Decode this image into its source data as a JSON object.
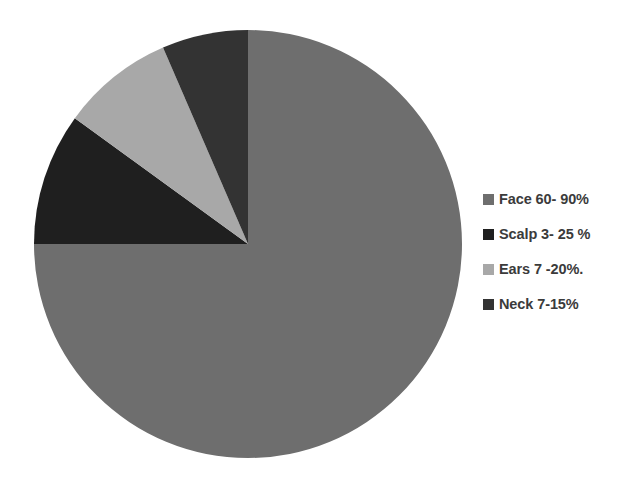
{
  "chart_data": {
    "type": "pie",
    "title": "",
    "subtitle": "",
    "xlabel": "",
    "ylabel": "",
    "grid": false,
    "legend_position": "right",
    "start_angle_deg": 0,
    "direction": "clockwise",
    "categories": [
      "Face",
      "Scalp",
      "Ears",
      "Neck"
    ],
    "values": [
      75,
      10,
      8.5,
      6.5
    ],
    "value_unit": "percent of pie",
    "labels": [
      "Face 60- 90%",
      "Scalp 3- 25 %",
      "Ears 7 -20%.",
      "Neck 7-15%"
    ],
    "colors": [
      "#6e6e6e",
      "#1f1f1f",
      "#a8a8a8",
      "#333333"
    ],
    "slices": [
      {
        "name": "Face",
        "label": "Face 60- 90%",
        "range_text": "60- 90%",
        "range_min": 60,
        "range_max": 90,
        "share": 75,
        "color": "#6e6e6e",
        "start_deg": 0,
        "end_deg": 270
      },
      {
        "name": "Scalp",
        "label": "Scalp 3- 25 %",
        "range_text": "3- 25 %",
        "range_min": 3,
        "range_max": 25,
        "share": 10,
        "color": "#1f1f1f",
        "start_deg": 270,
        "end_deg": 306
      },
      {
        "name": "Ears",
        "label": "Ears 7 -20%.",
        "range_text": "7 -20%.",
        "range_min": 7,
        "range_max": 20,
        "share": 8.5,
        "color": "#a8a8a8",
        "start_deg": 306,
        "end_deg": 336.6
      },
      {
        "name": "Neck",
        "label": "Neck 7-15%",
        "range_text": "7-15%",
        "range_min": 7,
        "range_max": 15,
        "share": 6.5,
        "color": "#333333",
        "start_deg": 336.6,
        "end_deg": 360
      }
    ]
  },
  "legend": {
    "items": [
      {
        "label": "Face 60- 90%",
        "color": "#6e6e6e"
      },
      {
        "label": "Scalp 3- 25 %",
        "color": "#1f1f1f"
      },
      {
        "label": "Ears 7 -20%.",
        "color": "#a8a8a8"
      },
      {
        "label": "Neck 7-15%",
        "color": "#333333"
      }
    ]
  }
}
